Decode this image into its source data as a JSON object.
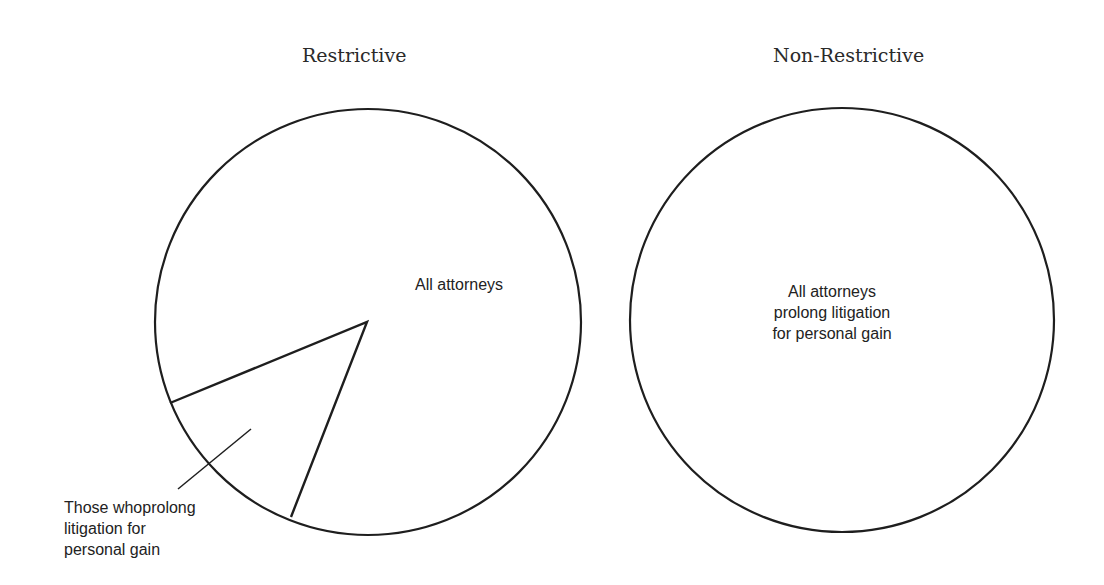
{
  "diagram": {
    "panels": [
      {
        "title": "Restrictive",
        "whole_label": "All attorneys",
        "subset_label_lines": [
          "Those whoprolong",
          "litigation for",
          "personal gain"
        ]
      },
      {
        "title": "Non-Restrictive",
        "whole_label_lines": [
          "All attorneys",
          "prolong litigation",
          "for personal gain"
        ]
      }
    ],
    "colors": {
      "stroke": "#1e1e1e",
      "background": "#ffffff",
      "text": "#222222"
    }
  }
}
